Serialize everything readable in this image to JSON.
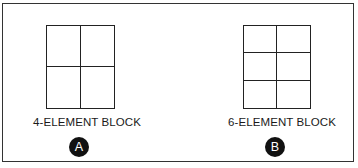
{
  "figure": {
    "blocks": [
      {
        "id": "A",
        "label": "4-ELEMENT BLOCK",
        "badge": "A",
        "rows": 2,
        "cols": 2
      },
      {
        "id": "B",
        "label": "6-ELEMENT BLOCK",
        "badge": "B",
        "rows": 3,
        "cols": 2
      }
    ],
    "colors": {
      "line": "#222222",
      "badge_bg": "#111111",
      "badge_text": "#ffffff",
      "background": "#ffffff"
    }
  }
}
